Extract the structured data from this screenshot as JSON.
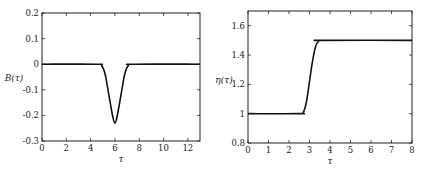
{
  "chart_data": [
    {
      "type": "line",
      "title": "",
      "xlabel": "τ",
      "ylabel": "B(τ)",
      "xlim": [
        0,
        13
      ],
      "ylim": [
        -0.3,
        0.2
      ],
      "xticks": [
        0,
        2,
        4,
        6,
        8,
        10,
        12
      ],
      "yticks": [
        -0.3,
        -0.2,
        -0.1,
        0,
        0.1,
        0.2
      ],
      "xtick_labels": [
        "0",
        "2",
        "4",
        "6",
        "8",
        "10",
        "12"
      ],
      "ytick_labels": [
        "-0.3",
        "-0.2",
        "-0.1",
        "0",
        "0.1",
        "0.2"
      ],
      "grid": false,
      "legend": null,
      "series": [
        {
          "name": "B(τ)",
          "x": [
            0,
            4.5,
            4.9,
            5.2,
            5.5,
            5.8,
            6.0,
            6.2,
            6.5,
            6.8,
            7.1,
            7.5,
            13
          ],
          "values": [
            0,
            0,
            -0.005,
            -0.04,
            -0.12,
            -0.2,
            -0.23,
            -0.2,
            -0.12,
            -0.04,
            -0.005,
            0,
            0
          ]
        }
      ]
    },
    {
      "type": "line",
      "title": "",
      "xlabel": "τ",
      "ylabel": "η(τ)",
      "xlim": [
        0,
        8
      ],
      "ylim": [
        0.8,
        1.7
      ],
      "xticks": [
        0,
        1,
        2,
        3,
        4,
        5,
        6,
        7,
        8
      ],
      "yticks": [
        0.8,
        1.0,
        1.2,
        1.4,
        1.6
      ],
      "xtick_labels": [
        "0",
        "1",
        "2",
        "3",
        "4",
        "5",
        "6",
        "7",
        "8"
      ],
      "ytick_labels": [
        "0.8",
        "1",
        "1.2",
        "1.4",
        "1.6"
      ],
      "grid": false,
      "legend": null,
      "series": [
        {
          "name": "η(τ)",
          "x": [
            0,
            2.5,
            2.7,
            2.85,
            3.0,
            3.15,
            3.3,
            3.45,
            3.6,
            8
          ],
          "values": [
            1.0,
            1.0,
            1.01,
            1.08,
            1.22,
            1.36,
            1.46,
            1.495,
            1.5,
            1.5
          ]
        }
      ]
    }
  ]
}
